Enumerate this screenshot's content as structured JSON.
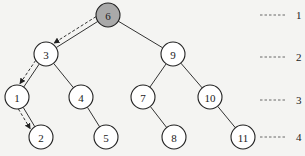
{
  "diagram": {
    "type": "binary-search-tree",
    "highlight_color": "#a9a9a9",
    "node_fill": "#ffffff",
    "nodes": [
      {
        "id": "n6",
        "label": "6",
        "x": 108,
        "y": 15,
        "level": 1,
        "highlighted": true
      },
      {
        "id": "n3",
        "label": "3",
        "x": 46,
        "y": 54,
        "level": 2,
        "highlighted": false
      },
      {
        "id": "n9",
        "label": "9",
        "x": 173,
        "y": 54,
        "level": 2,
        "highlighted": false
      },
      {
        "id": "n1",
        "label": "1",
        "x": 17,
        "y": 97,
        "level": 3,
        "highlighted": false
      },
      {
        "id": "n4",
        "label": "4",
        "x": 81,
        "y": 97,
        "level": 3,
        "highlighted": false
      },
      {
        "id": "n7",
        "label": "7",
        "x": 143,
        "y": 97,
        "level": 3,
        "highlighted": false
      },
      {
        "id": "n10",
        "label": "10",
        "x": 210,
        "y": 97,
        "level": 3,
        "highlighted": false
      },
      {
        "id": "n2",
        "label": "2",
        "x": 41,
        "y": 137,
        "level": 4,
        "highlighted": false
      },
      {
        "id": "n5",
        "label": "5",
        "x": 106,
        "y": 137,
        "level": 4,
        "highlighted": false
      },
      {
        "id": "n8",
        "label": "8",
        "x": 174,
        "y": 137,
        "level": 4,
        "highlighted": false
      },
      {
        "id": "n11",
        "label": "11",
        "x": 243,
        "y": 137,
        "level": 4,
        "highlighted": false
      }
    ],
    "edges": [
      {
        "from": "n6",
        "to": "n3"
      },
      {
        "from": "n6",
        "to": "n9"
      },
      {
        "from": "n3",
        "to": "n1"
      },
      {
        "from": "n3",
        "to": "n4"
      },
      {
        "from": "n9",
        "to": "n7"
      },
      {
        "from": "n9",
        "to": "n10"
      },
      {
        "from": "n1",
        "to": "n2"
      },
      {
        "from": "n4",
        "to": "n5"
      },
      {
        "from": "n7",
        "to": "n8"
      },
      {
        "from": "n10",
        "to": "n11"
      }
    ],
    "search_path": [
      "n6",
      "n3",
      "n1",
      "n2"
    ],
    "levels": [
      {
        "label": "1",
        "y": 15
      },
      {
        "label": "2",
        "y": 57
      },
      {
        "label": "3",
        "y": 100
      },
      {
        "label": "4",
        "y": 137
      }
    ]
  }
}
